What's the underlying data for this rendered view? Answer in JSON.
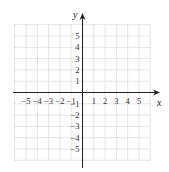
{
  "diagram": {
    "type": "coordinate-grid",
    "x_axis_label": "x",
    "y_axis_label": "y",
    "x_range": [
      -6,
      6
    ],
    "y_range": [
      -6,
      6
    ],
    "x_tick_labels": [
      "−5",
      "−4",
      "−3",
      "−2",
      "−1",
      "1",
      "2",
      "3",
      "4",
      "5"
    ],
    "x_tick_values": [
      -5,
      -4,
      -3,
      -2,
      -1,
      1,
      2,
      3,
      4,
      5
    ],
    "y_tick_labels": [
      "5",
      "4",
      "3",
      "2",
      "1",
      "−1",
      "−2",
      "−3",
      "−4",
      "−5"
    ],
    "y_tick_values": [
      5,
      4,
      3,
      2,
      1,
      -1,
      -2,
      -3,
      -4,
      -5
    ],
    "grid": "dotted",
    "colors": {
      "grid": "#b8b8b8",
      "axis": "#222222",
      "text": "#333333"
    }
  }
}
